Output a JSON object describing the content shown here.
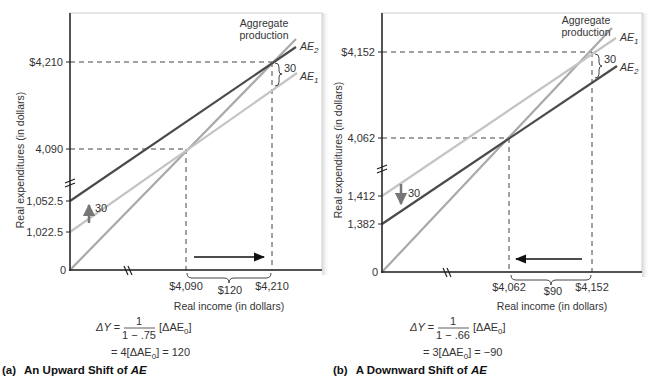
{
  "colors": {
    "ae_dark": "#4a4a4a",
    "ae_light": "#c4c4c4",
    "aggregate_production": "#a9a9a9",
    "axis": "#222222",
    "shift_arrow": "#777777"
  },
  "panels": [
    {
      "id": "a",
      "caption_prefix": "(a)",
      "caption_text": "An Upward Shift of ",
      "caption_italic": "AE",
      "y_axis_label": "Real expenditures (in dollars)",
      "x_axis_label": "Real income (in dollars)",
      "y_ticks": [
        "$4,210",
        "4,090",
        "1,052.5",
        "1,022.5",
        "0"
      ],
      "x_ticks": [
        "$4,090",
        "$4,210"
      ],
      "x_gap_label": "$120",
      "shift_label": "30",
      "gap_label": "30",
      "curve_labels": {
        "aggregate_production_line1": "Aggregate",
        "aggregate_production_line2": "production",
        "upper_ae": "AE",
        "upper_ae_sub": "2",
        "lower_ae": "AE",
        "lower_ae_sub": "1"
      },
      "equation": {
        "lhs": "ΔY =",
        "numerator": "1",
        "denominator": "1 − .75",
        "bracket": "[ΔAE",
        "bracket_sub": "0",
        "bracket_close": "]",
        "line2_prefix": "= 4[ΔAE",
        "line2_sub": "0",
        "line2_suffix": "] = 120"
      }
    },
    {
      "id": "b",
      "caption_prefix": "(b)",
      "caption_text": "A Downward Shift of ",
      "caption_italic": "AE",
      "y_axis_label": "Real expenditures (in dollars)",
      "x_axis_label": "Real income (in dollars)",
      "y_ticks": [
        "$4,152",
        "4,062",
        "1,412",
        "1,382",
        "0"
      ],
      "x_ticks": [
        "$4,062",
        "$4,152"
      ],
      "x_gap_label": "$90",
      "shift_label": "30",
      "gap_label": "30",
      "curve_labels": {
        "aggregate_production_line1": "Aggregate",
        "aggregate_production_line2": "production",
        "upper_ae": "AE",
        "upper_ae_sub": "1",
        "lower_ae": "AE",
        "lower_ae_sub": "2"
      },
      "equation": {
        "lhs": "ΔY =",
        "numerator": "1",
        "denominator": "1 − .66",
        "bracket": "[ΔAE",
        "bracket_sub": "0",
        "bracket_close": "]",
        "line2_prefix": "= 3[ΔAE",
        "line2_sub": "0",
        "line2_suffix": "] = −90"
      }
    }
  ]
}
